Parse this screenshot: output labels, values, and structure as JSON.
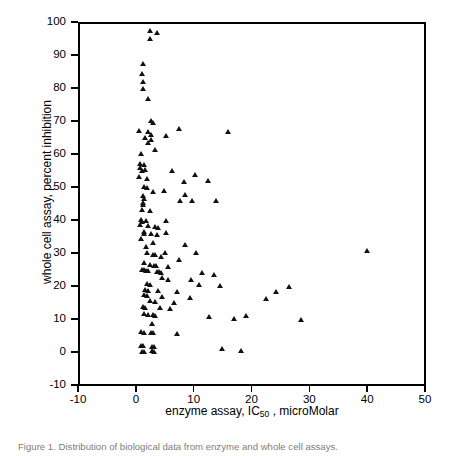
{
  "figure": {
    "caption": "Figure 1. Distribution of biological data from enzyme and whole cell assays."
  },
  "chart_data": {
    "type": "scatter",
    "title": "",
    "xlabel": "enzyme assay, IC50 , microMolar",
    "xlabel_parts": {
      "pre": "enzyme assay, IC",
      "sub": "50",
      "post": " , microMolar"
    },
    "ylabel": "whole cell assay, percent inhibition",
    "xlim": [
      -10,
      50
    ],
    "ylim": [
      -10,
      100
    ],
    "xticks": [
      -10,
      0,
      10,
      20,
      30,
      40,
      50
    ],
    "yticks": [
      -10,
      0,
      10,
      20,
      30,
      40,
      50,
      60,
      70,
      80,
      90,
      100
    ],
    "grid": false,
    "legend": null,
    "marker": "triangle",
    "marker_color": "#111111",
    "points": [
      [
        2.4,
        97.5
      ],
      [
        3.7,
        96.8
      ],
      [
        2.4,
        95.0
      ],
      [
        1.3,
        87.5
      ],
      [
        1.0,
        84.3
      ],
      [
        1.3,
        81.8
      ],
      [
        1.3,
        79.8
      ],
      [
        2.2,
        76.8
      ],
      [
        2.6,
        70.2
      ],
      [
        2.9,
        69.5
      ],
      [
        7.5,
        67.8
      ],
      [
        16.0,
        66.7
      ],
      [
        0.6,
        67.0
      ],
      [
        2.2,
        66.8
      ],
      [
        2.6,
        65.8
      ],
      [
        5.3,
        65.6
      ],
      [
        1.6,
        65.0
      ],
      [
        2.6,
        64.2
      ],
      [
        2.2,
        63.3
      ],
      [
        3.3,
        61.3
      ],
      [
        0.9,
        60.0
      ],
      [
        0.8,
        57.0
      ],
      [
        1.4,
        56.8
      ],
      [
        0.8,
        55.8
      ],
      [
        1.6,
        55.3
      ],
      [
        1.1,
        54.8
      ],
      [
        10.2,
        53.6
      ],
      [
        0.6,
        53.0
      ],
      [
        1.9,
        52.6
      ],
      [
        8.4,
        51.6
      ],
      [
        1.5,
        50.2
      ],
      [
        1.9,
        49.8
      ],
      [
        2.9,
        48.7
      ],
      [
        8.6,
        47.7
      ],
      [
        1.2,
        47.5
      ],
      [
        1.4,
        46.6
      ],
      [
        9.7,
        45.8
      ],
      [
        7.7,
        45.7
      ],
      [
        1.2,
        45.3
      ],
      [
        1.2,
        44.5
      ],
      [
        1.0,
        43.0
      ],
      [
        2.5,
        42.7
      ],
      [
        0.9,
        40.2
      ],
      [
        1.8,
        39.9
      ],
      [
        5.2,
        39.8
      ],
      [
        1.1,
        39.5
      ],
      [
        0.7,
        38.6
      ],
      [
        2.2,
        38.2
      ],
      [
        3.4,
        37.9
      ],
      [
        3.8,
        37.6
      ],
      [
        1.4,
        36.6
      ],
      [
        1.5,
        36.0
      ],
      [
        2.6,
        35.8
      ],
      [
        3.6,
        35.4
      ],
      [
        0.9,
        34.2
      ],
      [
        8.6,
        32.4
      ],
      [
        1.7,
        31.8
      ],
      [
        40.0,
        30.6
      ],
      [
        2.0,
        30.0
      ],
      [
        3.0,
        29.6
      ],
      [
        3.4,
        29.4
      ],
      [
        4.3,
        28.8
      ],
      [
        1.5,
        27.0
      ],
      [
        2.4,
        26.5
      ],
      [
        3.1,
        26.3
      ],
      [
        3.5,
        26.1
      ],
      [
        5.5,
        26.0
      ],
      [
        1.0,
        25.0
      ],
      [
        1.4,
        24.8
      ],
      [
        1.8,
        24.6
      ],
      [
        2.2,
        24.5
      ],
      [
        3.6,
        24.3
      ],
      [
        4.0,
        24.2
      ],
      [
        4.4,
        24.0
      ],
      [
        11.4,
        24.0
      ],
      [
        13.6,
        23.3
      ],
      [
        5.6,
        22.0
      ],
      [
        9.6,
        21.8
      ],
      [
        2.0,
        20.6
      ],
      [
        2.4,
        20.4
      ],
      [
        11.0,
        20.4
      ],
      [
        14.6,
        20.0
      ],
      [
        26.5,
        19.7
      ],
      [
        1.6,
        19.0
      ],
      [
        2.1,
        18.6
      ],
      [
        3.8,
        18.5
      ],
      [
        7.2,
        18.2
      ],
      [
        24.3,
        18.2
      ],
      [
        1.4,
        17.4
      ],
      [
        1.9,
        17.0
      ],
      [
        4.6,
        16.8
      ],
      [
        9.3,
        16.6
      ],
      [
        22.5,
        16.3
      ],
      [
        2.5,
        15.4
      ],
      [
        3.4,
        15.2
      ],
      [
        6.6,
        15.0
      ],
      [
        1.2,
        13.6
      ],
      [
        1.6,
        13.4
      ],
      [
        4.2,
        13.3
      ],
      [
        6.0,
        13.0
      ],
      [
        1.5,
        11.6
      ],
      [
        2.2,
        11.4
      ],
      [
        3.0,
        11.2
      ],
      [
        3.3,
        11.0
      ],
      [
        12.7,
        10.6
      ],
      [
        17.0,
        10.2
      ],
      [
        28.6,
        9.7
      ],
      [
        2.8,
        8.6
      ],
      [
        0.9,
        6.1
      ],
      [
        1.4,
        5.9
      ],
      [
        2.6,
        6.0
      ],
      [
        3.0,
        5.9
      ],
      [
        7.2,
        5.6
      ],
      [
        0.9,
        2.0
      ],
      [
        1.3,
        1.9
      ],
      [
        2.8,
        1.7
      ],
      [
        3.2,
        1.6
      ],
      [
        14.9,
        1.0
      ],
      [
        18.2,
        0.4
      ],
      [
        1.0,
        0.2
      ],
      [
        1.5,
        0.1
      ],
      [
        2.8,
        0.3
      ],
      [
        3.2,
        0.2
      ],
      [
        5.2,
        36.2
      ],
      [
        4.9,
        48.9
      ],
      [
        12.5,
        52.0
      ],
      [
        13.8,
        45.9
      ],
      [
        6.3,
        55.0
      ],
      [
        2.9,
        33.0
      ],
      [
        4.6,
        22.6
      ],
      [
        5.0,
        30.2
      ],
      [
        7.5,
        28.0
      ],
      [
        10.4,
        30.0
      ],
      [
        19.0,
        11.0
      ]
    ]
  }
}
